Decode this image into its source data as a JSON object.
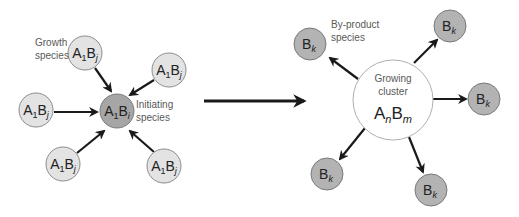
{
  "colors": {
    "growth_fill": "#e3e3e3",
    "initiating_fill": "#a6a6a6",
    "byproduct_fill": "#b3b3b3",
    "cluster_fill": "#ffffff",
    "stroke": "#8c8c8c",
    "arrow": "#1a1a1a",
    "label": "#595959"
  },
  "left_panel": {
    "growth_label": [
      "Growth",
      "species"
    ],
    "initiating_label": [
      "Initiating",
      "species"
    ],
    "growth_node": {
      "base_a": "A",
      "sub_a": "1",
      "base_b": "B",
      "sub_b": "j"
    },
    "initiating_node": {
      "base_a": "A",
      "sub_a": "1",
      "base_b": "B",
      "sub_b": "i"
    }
  },
  "right_panel": {
    "byproduct_label": [
      "By-product",
      "species"
    ],
    "cluster_label": [
      "Growing",
      "cluster"
    ],
    "cluster_node": {
      "base_a": "A",
      "sub_a": "n",
      "base_b": "B",
      "sub_b": "m"
    },
    "byproduct_node": {
      "base": "B",
      "sub": "k"
    }
  }
}
